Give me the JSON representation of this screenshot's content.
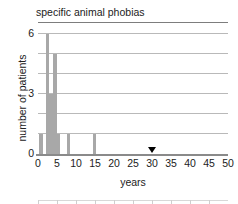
{
  "chart_data": {
    "type": "bar",
    "title": "specific animal phobias",
    "xlabel": "years",
    "ylabel": "number of patients",
    "xlim": [
      0,
      50
    ],
    "ylim": [
      0,
      6.6
    ],
    "grid": true,
    "legend": "none",
    "xticks": [
      0,
      5,
      10,
      15,
      20,
      25,
      30,
      35,
      40,
      45,
      50
    ],
    "xtick_labels": [
      "0",
      "5",
      "10",
      "15",
      "20",
      "25",
      "30",
      "35",
      "40",
      "45",
      "50"
    ],
    "yticks": [
      0,
      3,
      6
    ],
    "ytick_labels": [
      "0",
      "3",
      "6"
    ],
    "gridlines_y": [
      1,
      2,
      3,
      4,
      5,
      6
    ],
    "bar_color": "#a8a8a8",
    "grid_color": "#b9b9b9",
    "axis_color": "#8a8a8a",
    "bars": [
      {
        "x": 0.3,
        "width": 0.9,
        "value": 1
      },
      {
        "x": 2.0,
        "width": 0.9,
        "value": 6
      },
      {
        "x": 3.0,
        "width": 0.9,
        "value": 3
      },
      {
        "x": 4.0,
        "width": 0.9,
        "value": 5
      },
      {
        "x": 5.0,
        "width": 0.9,
        "value": 1
      },
      {
        "x": 7.6,
        "width": 0.9,
        "value": 1
      },
      {
        "x": 14.4,
        "width": 0.9,
        "value": 1
      }
    ],
    "annotations": [
      {
        "type": "marker-triangle",
        "shape": "down-triangle",
        "x": 30,
        "y": 0,
        "color": "#000000"
      }
    ]
  }
}
